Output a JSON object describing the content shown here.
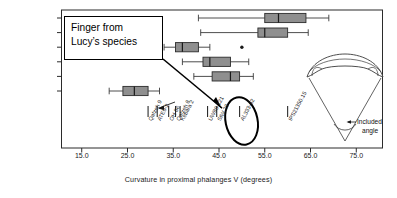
{
  "figure": {
    "title": "",
    "callout_text_line1": "Finger from",
    "callout_text_line2": "Lucy’s species",
    "inset_label_line1": "Included",
    "inset_label_line2": "angle"
  },
  "chart_data": {
    "type": "box",
    "title": "",
    "xlabel": "Curvature in proximal phalanges V (degrees)",
    "ylabel": "",
    "xlim": [
      12.0,
      78.0
    ],
    "xticks": [
      15.0,
      25.0,
      35.0,
      45.0,
      55.0,
      65.0,
      75.0
    ],
    "xtick_labels": [
      "15.0",
      "25.0",
      "35.0",
      "45.0",
      "55.0",
      "65.0",
      "75.0"
    ],
    "grid": false,
    "legend": "none",
    "categories": [
      "Hylobatidae",
      "Pongo",
      "Gorilla",
      "Pan troglodytes",
      "Pan paniscus",
      "Homo sapiens"
    ],
    "boxes": [
      {
        "name": "Hylobatidae",
        "whisker_low": 40.5,
        "q1": 55.0,
        "median": 58.0,
        "q3": 64.0,
        "whisker_high": 69.0,
        "outliers": []
      },
      {
        "name": "Pongo",
        "whisker_low": 41.0,
        "q1": 53.5,
        "median": 55.0,
        "q3": 60.0,
        "whisker_high": 64.5,
        "outliers": []
      },
      {
        "name": "Gorilla",
        "whisker_low": 33.0,
        "q1": 35.5,
        "median": 37.0,
        "q3": 40.5,
        "whisker_high": 43.0,
        "outliers": [
          50.0
        ]
      },
      {
        "name": "Pan troglodytes",
        "whisker_low": 37.0,
        "q1": 41.5,
        "median": 43.0,
        "q3": 47.5,
        "whisker_high": 51.5,
        "outliers": []
      },
      {
        "name": "Pan paniscus",
        "whisker_low": 39.5,
        "q1": 43.5,
        "median": 47.5,
        "q3": 49.5,
        "whisker_high": 52.5,
        "outliers": []
      },
      {
        "name": "Homo sapiens",
        "whisker_low": 21.0,
        "q1": 24.0,
        "median": 26.5,
        "q3": 29.5,
        "whisker_high": 32.0,
        "outliers": []
      }
    ],
    "specimen_marks": [
      {
        "label": "Qafzeh 9",
        "value": 29.5
      },
      {
        "label": "ATE9-2",
        "value": 31.5
      },
      {
        "label": "OH 86",
        "value": 34.0
      },
      {
        "label": "Qafzeh 8",
        "value": 35.5
      },
      {
        "label": "Kebara 2",
        "value": 36.5
      },
      {
        "label": "UW88-121",
        "value": 42.5
      },
      {
        "label": "StW 28",
        "value": 44.5
      },
      {
        "label": "AL333-92",
        "value": 49.5,
        "highlight": true
      },
      {
        "label": "IPS21350.15",
        "value": 60.0
      }
    ]
  },
  "axis": {
    "x_min": 12.0,
    "x_max": 78.0,
    "px_x_min": 68,
    "px_x_max": 370
  },
  "icons": {
    "phalanx_bone": "curved-bone-icon",
    "angle_wedge": "angle-wedge-icon",
    "arrow": "arrow-icon"
  }
}
